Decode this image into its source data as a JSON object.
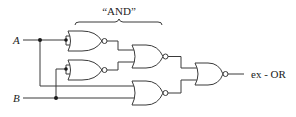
{
  "diagram": {
    "type": "logic-circuit",
    "brace_label": "“AND”",
    "inputs": [
      {
        "id": "A",
        "label": "A"
      },
      {
        "id": "B",
        "label": "B"
      }
    ],
    "output": {
      "label": "ex - OR"
    },
    "gates": [
      {
        "id": "g1",
        "type": "NOR",
        "inputs": [
          "A",
          "A"
        ],
        "note": "inverter on A"
      },
      {
        "id": "g2",
        "type": "NOR",
        "inputs": [
          "B",
          "B"
        ],
        "note": "inverter on B"
      },
      {
        "id": "g3",
        "type": "NOR",
        "inputs": [
          "g1",
          "g2"
        ],
        "note": "forms A AND B"
      },
      {
        "id": "g4",
        "type": "NOR",
        "inputs": [
          "A",
          "B"
        ]
      },
      {
        "id": "g5",
        "type": "NOR",
        "inputs": [
          "g3",
          "g4"
        ],
        "note": "output ex-OR"
      }
    ]
  }
}
